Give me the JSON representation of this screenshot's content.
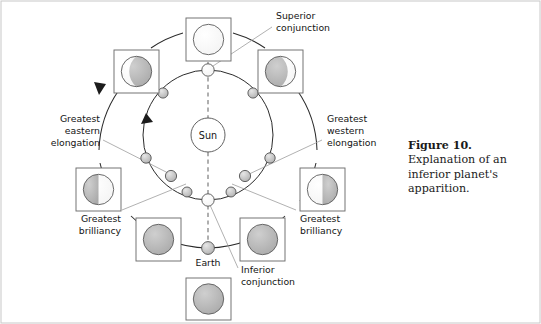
{
  "figure": {
    "caption_title": "Figure 10.",
    "caption_body": "Explanation of an inferior planet's apparition."
  },
  "diagram": {
    "sun_label": "Sun",
    "earth_label": "Earth",
    "labels": {
      "superior_conjunction": "Superior conjunction",
      "inferior_conjunction": "Inferior conjunction",
      "greatest_eastern_elongation": "Greatest eastern elongation",
      "greatest_western_elongation": "Greatest western elongation",
      "greatest_brilliancy_left": "Greatest brilliancy",
      "greatest_brilliancy_right": "Greatest brilliancy"
    },
    "label_lines": {
      "superior_conjunction": [
        "Superior",
        "conjunction"
      ],
      "inferior_conjunction": [
        "Inferior",
        "conjunction"
      ],
      "greatest_eastern_elongation": [
        "Greatest",
        "eastern",
        "elongation"
      ],
      "greatest_western_elongation": [
        "Greatest",
        "western",
        "elongation"
      ],
      "greatest_brilliancy_left": [
        "Greatest",
        "brilliancy"
      ],
      "greatest_brilliancy_right": [
        "Greatest",
        "brilliancy"
      ]
    },
    "colors": {
      "planet_lit": "#ffffff",
      "planet_dark": "#b4b4b4",
      "orbit_stroke": "#2b2b2b",
      "leader_stroke": "#9a9a9a",
      "dashed_axis": "#8e8e8e",
      "box_stroke": "#6d6d6d",
      "text": "#141414"
    },
    "orbits": {
      "planet_orbit_label": "inferior planet orbit",
      "earth_orbit_label": "Earth orbit",
      "planet_orbit_dot_count": 10,
      "direction": "counterclockwise"
    },
    "phase_boxes": [
      {
        "name": "superior-conjunction-phase",
        "phase": "full",
        "position": "top"
      },
      {
        "name": "waning-gibbous-phase-left",
        "phase": "gibbous-lit-right",
        "position": "upper-left"
      },
      {
        "name": "waxing-gibbous-phase-right",
        "phase": "gibbous-lit-left",
        "position": "upper-right"
      },
      {
        "name": "eastern-elongation-phase",
        "phase": "half-lit-right",
        "position": "left"
      },
      {
        "name": "western-elongation-phase",
        "phase": "half-lit-left",
        "position": "right"
      },
      {
        "name": "greatest-brilliancy-phase-left",
        "phase": "crescent-lit-right",
        "position": "lower-left"
      },
      {
        "name": "greatest-brilliancy-phase-right",
        "phase": "crescent-lit-left",
        "position": "lower-right"
      },
      {
        "name": "inferior-conjunction-phase",
        "phase": "new",
        "position": "bottom"
      }
    ]
  }
}
